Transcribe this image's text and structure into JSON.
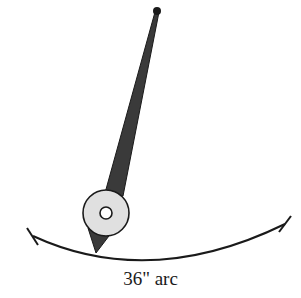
{
  "diagram": {
    "arc_label": "36\" arc",
    "colors": {
      "stroke": "#1a1a1a",
      "needle": "#3a3a3a",
      "hub_fill": "#e0e0e0",
      "background": "#ffffff"
    },
    "elements": {
      "pivot": {
        "cx": 157,
        "cy": 11,
        "r": 4
      },
      "hub": {
        "cx": 106,
        "cy": 213,
        "r": 23,
        "hole_r": 6
      },
      "needle_tip": {
        "x": 96,
        "y": 252
      },
      "arc": {
        "start": [
          33,
          236
        ],
        "end": [
          285,
          224
        ],
        "lowest_y": 262
      }
    }
  }
}
